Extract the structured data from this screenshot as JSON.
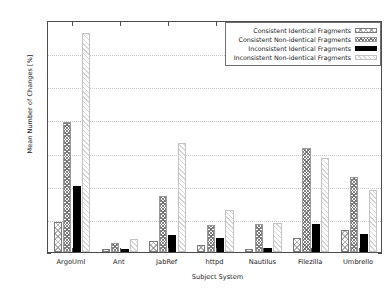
{
  "chart_data": {
    "type": "bar",
    "title": "",
    "xlabel": "Subject System",
    "ylabel": "Mean Number of Changes [%]",
    "ylim": [
      0,
      7
    ],
    "yticks": [
      0,
      1,
      2,
      3,
      4,
      5,
      6,
      7
    ],
    "grid": true,
    "legend_position": "top-right",
    "categories": [
      "ArgoUml",
      "Ant",
      "JabRef",
      "httpd",
      "Nautilus",
      "Filezilla",
      "Umbrello"
    ],
    "series": [
      {
        "name": "Consistent Identical Fragments",
        "pattern": "light-crosshatch",
        "values": [
          0.9,
          0.1,
          0.32,
          0.22,
          0.1,
          0.42,
          0.66
        ]
      },
      {
        "name": "Consistent Non-identical Fragments",
        "pattern": "dense-crosshatch",
        "values": [
          3.92,
          0.28,
          1.7,
          0.82,
          0.85,
          3.15,
          2.25
        ]
      },
      {
        "name": "Inconsistent Identical Fragments",
        "pattern": "solid-black",
        "values": [
          2.0,
          0.1,
          0.5,
          0.42,
          0.12,
          0.85,
          0.55
        ]
      },
      {
        "name": "Inconsistent Non-identical Fragments",
        "pattern": "light-diagonal",
        "values": [
          6.6,
          0.4,
          3.3,
          1.26,
          0.87,
          2.85,
          1.88
        ]
      }
    ],
    "colors": {
      "axis": "#4d4d4d",
      "grid": "#c8c8c8",
      "text": "#1a1a1a",
      "series_solid": "#000000",
      "background": "#ffffff"
    }
  }
}
